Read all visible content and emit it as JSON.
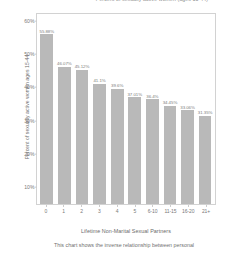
{
  "chart_data": {
    "type": "bar",
    "title": "Percent of sexually active women (ages 15-44)",
    "xlabel": "Lifetime Non-Marital Sexual Partners",
    "ylabel": "Percent of sexually active women ages 15-44",
    "categories": [
      "0",
      "1",
      "2",
      "3",
      "4",
      "5",
      "6-10",
      "11-15",
      "16-20",
      "21+"
    ],
    "values": [
      55.88,
      46.07,
      45.12,
      41.1,
      39.6,
      37.01,
      36.4,
      34.45,
      33.06,
      31.35
    ],
    "value_labels": [
      "55.88%",
      "46.07%",
      "45.12%",
      "41.1%",
      "39.6%",
      "37.01%",
      "36.4%",
      "34.45%",
      "33.06%",
      "31.35%"
    ],
    "ylim": [
      5,
      62
    ],
    "ytick_values": [
      60,
      50,
      40,
      30,
      20,
      10
    ],
    "ytick_labels": [
      "60%",
      "50%",
      "40%",
      "30%",
      "20%",
      "10%"
    ],
    "grid": false,
    "legend": null,
    "bar_color": "#b9b9b9",
    "frame_color": "#d2d2d2",
    "background_color": "#ffffff",
    "caption": "This chart shows the inverse relationship between personal"
  }
}
